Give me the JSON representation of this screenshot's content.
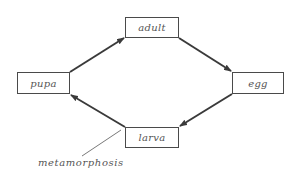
{
  "diagram": {
    "type": "cycle",
    "nodes": [
      {
        "id": "adult",
        "label": "adult",
        "x": 125,
        "y": 17,
        "w": 54,
        "h": 21
      },
      {
        "id": "egg",
        "label": "egg",
        "x": 232,
        "y": 72,
        "w": 52,
        "h": 22
      },
      {
        "id": "larva",
        "label": "larva",
        "x": 125,
        "y": 127,
        "w": 54,
        "h": 21
      },
      {
        "id": "pupa",
        "label": "pupa",
        "x": 17,
        "y": 72,
        "w": 53,
        "h": 22
      }
    ],
    "edges": [
      {
        "from": "pupa",
        "to": "adult"
      },
      {
        "from": "adult",
        "to": "egg"
      },
      {
        "from": "egg",
        "to": "larva"
      },
      {
        "from": "larva",
        "to": "pupa"
      }
    ],
    "annotation": {
      "label": "metamorphosis",
      "points_to": "larva-to-pupa transition"
    },
    "colors": {
      "arrow": "#3a3a3a",
      "box_border": "#4a4a4a",
      "text": "#555555"
    }
  }
}
